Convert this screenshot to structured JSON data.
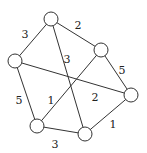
{
  "graph": {
    "nodes": [
      {
        "id": "A",
        "x": 51,
        "y": 19
      },
      {
        "id": "B",
        "x": 101,
        "y": 50
      },
      {
        "id": "C",
        "x": 15,
        "y": 61
      },
      {
        "id": "D",
        "x": 131,
        "y": 95
      },
      {
        "id": "E",
        "x": 37,
        "y": 126
      },
      {
        "id": "F",
        "x": 85,
        "y": 134
      }
    ],
    "edges": [
      {
        "from": "A",
        "to": "B",
        "weight": "2",
        "lx": 78,
        "ly": 26
      },
      {
        "from": "A",
        "to": "C",
        "weight": "3",
        "lx": 25,
        "ly": 35
      },
      {
        "from": "A",
        "to": "F",
        "weight": "3",
        "lx": 67,
        "ly": 60
      },
      {
        "from": "B",
        "to": "D",
        "weight": "5",
        "lx": 122,
        "ly": 71
      },
      {
        "from": "B",
        "to": "E",
        "weight": "1",
        "lx": 51,
        "ly": 101
      },
      {
        "from": "C",
        "to": "D",
        "weight": "2",
        "lx": 95,
        "ly": 98
      },
      {
        "from": "C",
        "to": "E",
        "weight": "5",
        "lx": 19,
        "ly": 101
      },
      {
        "from": "E",
        "to": "F",
        "weight": "3",
        "lx": 55,
        "ly": 145
      },
      {
        "from": "F",
        "to": "D",
        "weight": "1",
        "lx": 113,
        "ly": 125
      }
    ],
    "node_radius": 7
  }
}
